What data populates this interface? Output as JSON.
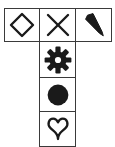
{
  "figure": {
    "background_color": "#ffffff",
    "border_color": "#3a3a3a",
    "symbol_color": "#1a1a1a",
    "columns": 3,
    "rows": 4,
    "cell_count": 6
  },
  "cells": [
    {
      "id": "r1c1",
      "row": 1,
      "column": 1,
      "icon": "diamond-outline-icon",
      "label": "Diamond",
      "fill": "none",
      "stroke": "#1a1a1a"
    },
    {
      "id": "r1c2",
      "row": 1,
      "column": 2,
      "icon": "cross-x-icon",
      "label": "X cross",
      "fill": "none",
      "stroke": "#1a1a1a"
    },
    {
      "id": "r1c3",
      "row": 1,
      "column": 3,
      "icon": "pen-nib-icon",
      "label": "Pen nib wedge",
      "fill": "#1a1a1a",
      "stroke": "none"
    },
    {
      "id": "r2c2",
      "row": 2,
      "column": 2,
      "icon": "gear-icon",
      "label": "Gear",
      "fill": "#1a1a1a",
      "stroke": "none"
    },
    {
      "id": "r3c2",
      "row": 3,
      "column": 2,
      "icon": "filled-circle-icon",
      "label": "Filled circle",
      "fill": "#1a1a1a",
      "stroke": "none"
    },
    {
      "id": "r4c2",
      "row": 4,
      "column": 2,
      "icon": "inverted-heart-outline-icon",
      "label": "Inverted heart",
      "fill": "none",
      "stroke": "#1a1a1a"
    }
  ]
}
